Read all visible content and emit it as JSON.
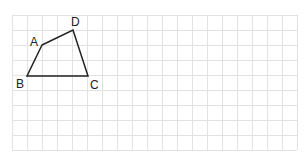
{
  "diagram": {
    "type": "quadrilateral-on-grid",
    "grid": {
      "x0": 12,
      "y0": 15,
      "cell": 15,
      "cols": 19,
      "rows": 9,
      "line_color": "#e2e2e2"
    },
    "shape_color": "#222222",
    "vertices": [
      {
        "label": "A",
        "x": 42,
        "y": 45
      },
      {
        "label": "D",
        "x": 73,
        "y": 30
      },
      {
        "label": "C",
        "x": 88,
        "y": 76
      },
      {
        "label": "B",
        "x": 27,
        "y": 76
      }
    ],
    "labels": {
      "A": "A",
      "B": "B",
      "C": "C",
      "D": "D"
    }
  }
}
